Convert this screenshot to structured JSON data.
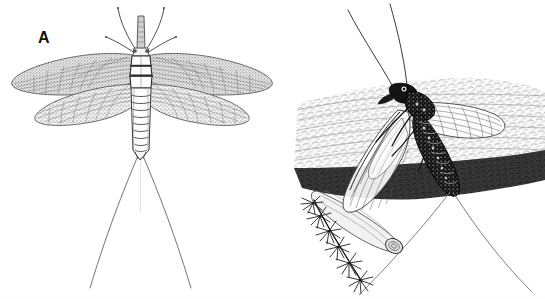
{
  "figure": {
    "type": "scientific-illustration",
    "technique": "pen-and-ink line drawing",
    "background_color": "#ffffff",
    "width": 545,
    "height": 299,
    "panel_count": 2
  },
  "panels": [
    {
      "id": "A",
      "label": "A",
      "label_color": "#121212",
      "subject": "mayfly adult, dorsal view, wings spread",
      "order": "Ephemeroptera",
      "view": "dorsal",
      "elements": [
        "two pairs of membranous wings with fine venation",
        "large triangular forewings",
        "smaller rounded hindwings",
        "segmented pale abdomen",
        "banded thorax",
        "forelegs extended forward",
        "two long caudal filaments (cerci) forming a V"
      ],
      "wing_tone": "#9a9a9a",
      "body_tone": "#f2f2f2",
      "outline_color": "#2b2b2b"
    },
    {
      "id": "B",
      "label": "B",
      "label_color": "#121212",
      "subject": "dark mayfly resting on bark of a branch, lateral view",
      "order": "Ephemeroptera",
      "view": "lateral",
      "elements": [
        "dark speckled segmented body",
        "two long antennae curving upward",
        "pair of translucent veined wings held over body",
        "textured tree bark branch running diagonally",
        "moss or lichen sprig at lower left",
        "two long caudal filaments (cerci) trailing down-right"
      ],
      "body_tone": "#1a1a1a",
      "bark_tone": "#efefef",
      "moss_tone": "#141414",
      "outline_color": "#2b2b2b"
    }
  ],
  "colors": {
    "ink": "#2b2b2b",
    "dark_ink": "#111111",
    "wing_gray": "#9a9a9a",
    "light_gray": "#d8d8d8",
    "paper": "#ffffff"
  }
}
